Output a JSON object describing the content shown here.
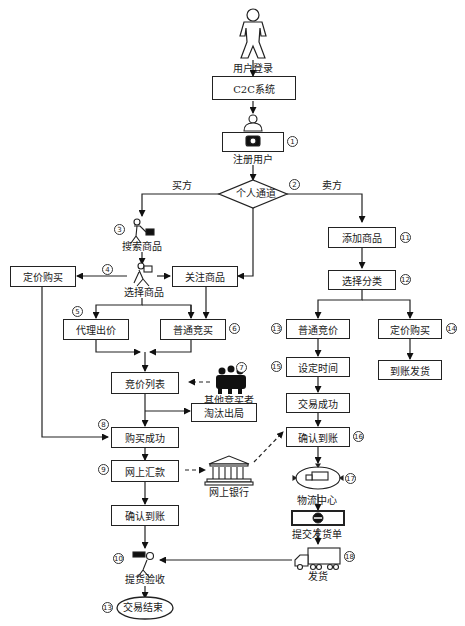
{
  "diagram": {
    "type": "flowchart"
  },
  "nodes": {
    "user_login": {
      "label": "用户登录",
      "icon": "person-icon"
    },
    "c2c_system": {
      "label": "C2C系统"
    },
    "register_user": {
      "label": "注册用户",
      "number": "①",
      "icon": "registration-user-icon"
    },
    "personal_channel": {
      "label": "个人通道",
      "number": "②",
      "shape": "diamond"
    },
    "buyer_branch": {
      "label": "买方"
    },
    "seller_branch": {
      "label": "卖方"
    },
    "search_goods": {
      "label": "搜索商品",
      "number": "③",
      "icon": "shopper-cart-icon"
    },
    "select_goods": {
      "label": "选择商品",
      "number": "④",
      "icon": "carrying-person-icon"
    },
    "fixed_price_buy_left": {
      "label": "定价购买"
    },
    "follow_goods": {
      "label": "关注商品"
    },
    "proxy_bid": {
      "label": "代理出价",
      "number": "⑤"
    },
    "normal_auction_buy": {
      "label": "普通竞买",
      "number": "⑥"
    },
    "bid_list": {
      "label": "竞价列表"
    },
    "other_bidders": {
      "label": "其他竞买者",
      "number": "⑦",
      "icon": "group-people-icon"
    },
    "eliminated": {
      "label": "淘汰出局"
    },
    "purchase_success": {
      "label": "购买成功",
      "number": "⑧"
    },
    "online_remit": {
      "label": "网上汇款",
      "number": "⑨"
    },
    "online_bank": {
      "label": "网上银行",
      "icon": "bank-building-icon"
    },
    "confirm_receipt_left": {
      "label": "确认到账"
    },
    "pickup_inspect": {
      "label": "提货验收",
      "number": "⑩",
      "icon": "courier-person-icon"
    },
    "trade_end": {
      "label": "交易结束",
      "number": "⑬",
      "shape": "ellipse"
    },
    "add_goods": {
      "label": "添加商品",
      "number": "⑪"
    },
    "select_category": {
      "label": "选择分类",
      "number": "⑫"
    },
    "normal_bid": {
      "label": "普通竞价",
      "number": "⑬"
    },
    "fixed_price_buy_right": {
      "label": "定价购买",
      "number": "⑭"
    },
    "ship_on_payment": {
      "label": "到账发货"
    },
    "set_time": {
      "label": "设定时间",
      "number": "⑮"
    },
    "trade_success": {
      "label": "交易成功"
    },
    "confirm_receipt_right": {
      "label": "确认到账",
      "number": "⑯"
    },
    "logistics_center": {
      "label": "物流中心",
      "number": "⑰",
      "icon": "logistics-truck-icon"
    },
    "submit_invoice": {
      "label": "提交发货单",
      "icon": "invoice-icon"
    },
    "shipping": {
      "label": "发货",
      "number": "⑱",
      "icon": "delivery-truck-icon"
    }
  },
  "edges": [
    [
      "user_login",
      "c2c_system"
    ],
    [
      "c2c_system",
      "register_user"
    ],
    [
      "register_user",
      "personal_channel"
    ],
    [
      "personal_channel",
      "search_goods",
      "买方"
    ],
    [
      "personal_channel",
      "add_goods",
      "卖方"
    ],
    [
      "personal_channel",
      "follow_goods"
    ],
    [
      "search_goods",
      "select_goods"
    ],
    [
      "select_goods",
      "fixed_price_buy_left"
    ],
    [
      "select_goods",
      "follow_goods"
    ],
    [
      "select_goods",
      "proxy_bid"
    ],
    [
      "select_goods",
      "normal_auction_buy"
    ],
    [
      "follow_goods",
      "normal_auction_buy"
    ],
    [
      "proxy_bid",
      "bid_list"
    ],
    [
      "normal_auction_buy",
      "bid_list"
    ],
    [
      "other_bidders",
      "bid_list",
      "dashed"
    ],
    [
      "bid_list",
      "eliminated"
    ],
    [
      "bid_list",
      "purchase_success"
    ],
    [
      "fixed_price_buy_left",
      "purchase_success"
    ],
    [
      "purchase_success",
      "online_remit"
    ],
    [
      "online_remit",
      "online_bank",
      "dashed"
    ],
    [
      "online_bank",
      "confirm_receipt_right",
      "dashed"
    ],
    [
      "online_remit",
      "confirm_receipt_left"
    ],
    [
      "confirm_receipt_left",
      "pickup_inspect"
    ],
    [
      "pickup_inspect",
      "trade_end"
    ],
    [
      "add_goods",
      "select_category"
    ],
    [
      "select_category",
      "normal_bid"
    ],
    [
      "select_category",
      "fixed_price_buy_right"
    ],
    [
      "fixed_price_buy_right",
      "ship_on_payment"
    ],
    [
      "normal_bid",
      "set_time"
    ],
    [
      "set_time",
      "trade_success"
    ],
    [
      "trade_success",
      "confirm_receipt_right"
    ],
    [
      "confirm_receipt_right",
      "logistics_center"
    ],
    [
      "logistics_center",
      "submit_invoice"
    ],
    [
      "submit_invoice",
      "shipping"
    ],
    [
      "shipping",
      "pickup_inspect"
    ]
  ]
}
